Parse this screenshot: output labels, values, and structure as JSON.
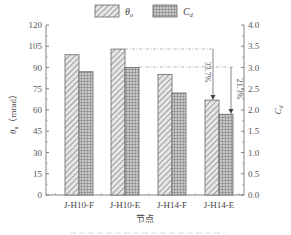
{
  "chart_data": {
    "type": "bar",
    "categories": [
      "J-H10-F",
      "J-H10-E",
      "J-H14-F",
      "J-H14-E"
    ],
    "series": [
      {
        "name": "θ_u",
        "axis": "left",
        "pattern": "diagonal-hatch",
        "values": [
          99,
          103,
          85,
          67
        ]
      },
      {
        "name": "C_d",
        "axis": "right",
        "pattern": "grid-hatch",
        "values": [
          2.9,
          3.0,
          2.4,
          1.9
        ]
      }
    ],
    "title": "",
    "xlabel": "节点",
    "ylabel": "θu（mrad）",
    "ylabel_right": "Cd",
    "ylim": [
      0,
      120
    ],
    "ylim_right": [
      0,
      4.0
    ],
    "yticks": [
      "0",
      "15",
      "30",
      "45",
      "60",
      "75",
      "90",
      "105",
      "120"
    ],
    "yticks_right": [
      "0.0",
      "0.5",
      "1.0",
      "1.5",
      "2.0",
      "2.5",
      "3.0",
      "3.5",
      "4.0"
    ],
    "legend": {
      "position": "top-center",
      "entries": [
        "θu",
        "Cd"
      ]
    },
    "annotations": [
      {
        "text": "33.7%",
        "from_series": "θ_u",
        "from": "J-H10-E",
        "to": "J-H14-E"
      },
      {
        "text": "21.3%",
        "from_series": "C_d",
        "from": "J-H10-E",
        "to": "J-H14-E"
      }
    ],
    "grid": false
  },
  "legend": {
    "theta_symbol": "θ",
    "theta_sub": "u",
    "cd_symbol": "C",
    "cd_sub": "d"
  },
  "axes": {
    "left_title_symbol": "θ",
    "left_title_sub": "u",
    "left_title_unit": "（mrad）",
    "right_title_symbol": "C",
    "right_title_sub": "d",
    "x_title": "节点"
  }
}
